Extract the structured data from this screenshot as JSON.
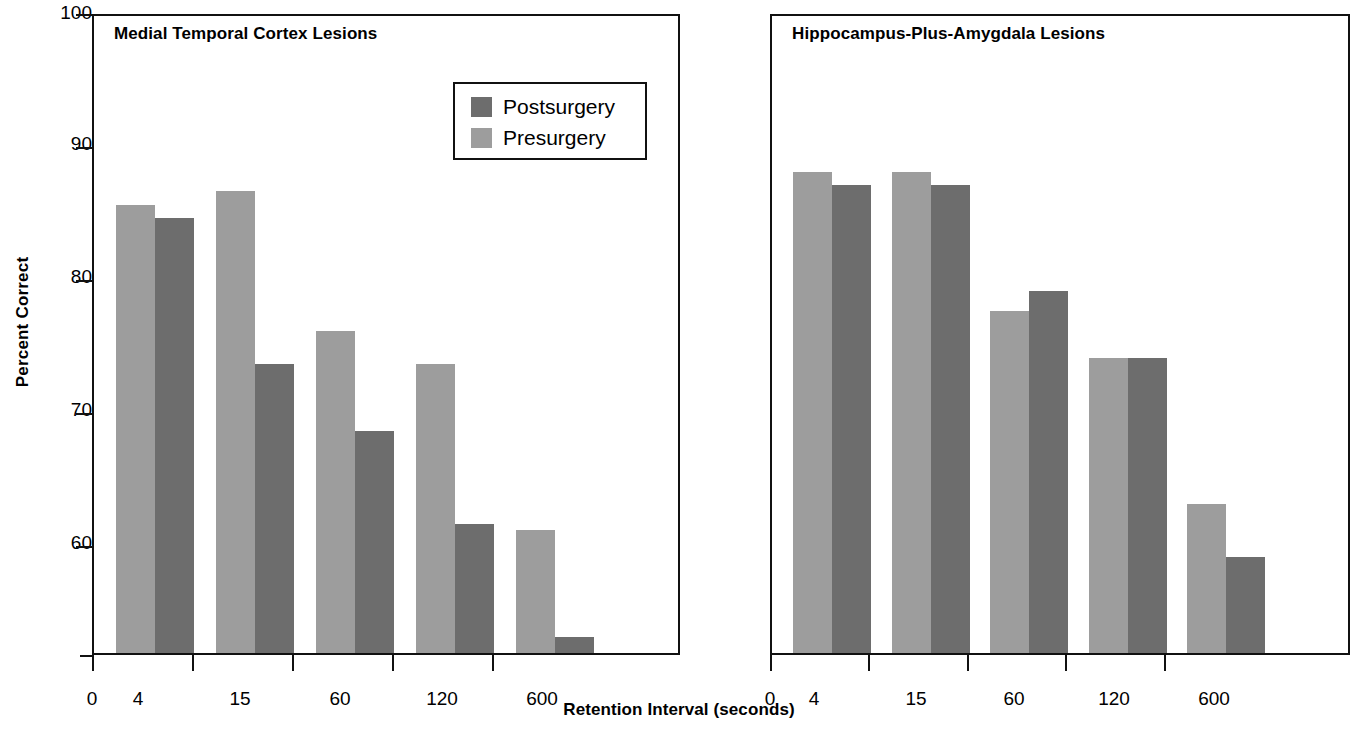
{
  "figure": {
    "yaxis_title": "Percent Correct",
    "xaxis_title": "Retention Interval (seconds)",
    "y_ticks": [
      "100",
      "90",
      "80",
      "70",
      "60"
    ],
    "x_origin_label": "0",
    "x_tick_labels": [
      "4",
      "15",
      "60",
      "120",
      "600"
    ]
  },
  "legend": {
    "series_1_label": "Postsurgery",
    "series_2_label": "Presurgery",
    "series_1_color": "#6d6d6d",
    "series_2_color": "#9d9d9d"
  },
  "panels": [
    {
      "title": "Medial Temporal Cortex Lesions"
    },
    {
      "title": "Hippocampus-Plus-Amygdala Lesions"
    }
  ],
  "chart_data": [
    {
      "type": "bar",
      "title": "Medial Temporal Cortex Lesions",
      "xlabel": "Retention Interval (seconds)",
      "ylabel": "Percent Correct",
      "ylim": [
        51,
        100
      ],
      "yticks": [
        60,
        70,
        80,
        90,
        100
      ],
      "grid": false,
      "legend_position": "top-right",
      "categories": [
        "4",
        "15",
        "60",
        "120",
        "600"
      ],
      "series": [
        {
          "name": "Presurgery",
          "color": "#9d9d9d",
          "values": [
            85.5,
            86.5,
            76.0,
            73.5,
            61.0
          ]
        },
        {
          "name": "Postsurgery",
          "color": "#6d6d6d",
          "values": [
            84.5,
            73.5,
            68.5,
            61.5,
            53.0
          ]
        }
      ]
    },
    {
      "type": "bar",
      "title": "Hippocampus-Plus-Amygdala Lesions",
      "xlabel": "Retention Interval (seconds)",
      "ylabel": "Percent Correct",
      "ylim": [
        51,
        100
      ],
      "yticks": [
        60,
        70,
        80,
        90,
        100
      ],
      "grid": false,
      "legend_position": "none",
      "categories": [
        "4",
        "15",
        "60",
        "120",
        "600"
      ],
      "series": [
        {
          "name": "Presurgery",
          "color": "#9d9d9d",
          "values": [
            88.0,
            88.0,
            77.5,
            74.0,
            63.0
          ]
        },
        {
          "name": "Postsurgery",
          "color": "#6d6d6d",
          "values": [
            87.0,
            87.0,
            79.0,
            74.0,
            59.0
          ]
        }
      ]
    }
  ]
}
